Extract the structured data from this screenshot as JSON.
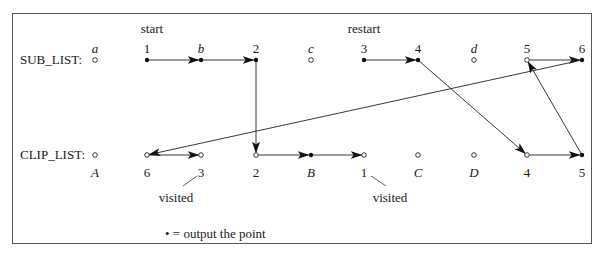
{
  "diagram": {
    "sub_list": {
      "label": "SUB_LIST:",
      "points": [
        {
          "name": "a",
          "italic": true,
          "x": 95,
          "filled": false
        },
        {
          "name": "1",
          "italic": false,
          "x": 147,
          "filled": true
        },
        {
          "name": "b",
          "italic": true,
          "x": 201,
          "filled": true
        },
        {
          "name": "2",
          "italic": false,
          "x": 256,
          "filled": true
        },
        {
          "name": "c",
          "italic": true,
          "x": 311,
          "filled": false
        },
        {
          "name": "3",
          "italic": false,
          "x": 364,
          "filled": true
        },
        {
          "name": "4",
          "italic": false,
          "x": 418,
          "filled": true
        },
        {
          "name": "d",
          "italic": true,
          "x": 474,
          "filled": false
        },
        {
          "name": "5",
          "italic": false,
          "x": 527,
          "filled": false
        },
        {
          "name": "6",
          "italic": false,
          "x": 582,
          "filled": true
        }
      ],
      "annotations": [
        {
          "text": "start",
          "x": 147
        },
        {
          "text": "restart",
          "x": 364
        }
      ]
    },
    "clip_list": {
      "label": "CLIP_LIST:",
      "points": [
        {
          "name": "A",
          "italic": true,
          "x": 95,
          "filled": false
        },
        {
          "name": "6",
          "italic": false,
          "x": 147,
          "filled": false
        },
        {
          "name": "3",
          "italic": false,
          "x": 201,
          "filled": false
        },
        {
          "name": "2",
          "italic": false,
          "x": 256,
          "filled": false
        },
        {
          "name": "B",
          "italic": true,
          "x": 311,
          "filled": true
        },
        {
          "name": "1",
          "italic": false,
          "x": 364,
          "filled": false
        },
        {
          "name": "C",
          "italic": true,
          "x": 418,
          "filled": false
        },
        {
          "name": "D",
          "italic": true,
          "x": 474,
          "filled": false
        },
        {
          "name": "4",
          "italic": false,
          "x": 527,
          "filled": false
        },
        {
          "name": "5",
          "italic": false,
          "x": 582,
          "filled": true
        }
      ],
      "annotations": [
        {
          "text": "visited",
          "ref": "3"
        },
        {
          "text": "visited",
          "ref": "1"
        }
      ]
    },
    "edges": [
      {
        "from": "SUB:1",
        "to": "SUB:b"
      },
      {
        "from": "SUB:b",
        "to": "SUB:2"
      },
      {
        "from": "SUB:2",
        "to": "CLIP:2"
      },
      {
        "from": "CLIP:2",
        "to": "CLIP:B"
      },
      {
        "from": "CLIP:B",
        "to": "CLIP:1"
      },
      {
        "from": "SUB:3",
        "to": "SUB:4"
      },
      {
        "from": "SUB:4",
        "to": "CLIP:4"
      },
      {
        "from": "CLIP:4",
        "to": "CLIP:5"
      },
      {
        "from": "CLIP:5",
        "to": "SUB:5"
      },
      {
        "from": "SUB:5",
        "to": "SUB:6"
      },
      {
        "from": "SUB:6",
        "to": "CLIP:6"
      },
      {
        "from": "CLIP:6",
        "to": "CLIP:3"
      }
    ],
    "legend": {
      "symbol": "•",
      "text": "= output the point"
    }
  }
}
